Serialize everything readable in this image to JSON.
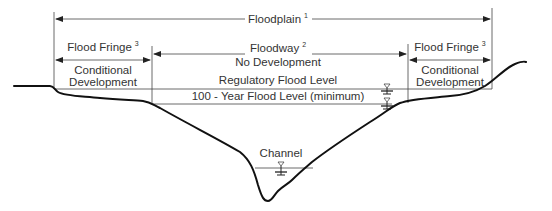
{
  "diagram": {
    "labels": {
      "floodplain": {
        "text": "Floodplain",
        "note": "1"
      },
      "floodway": {
        "text": "Floodway",
        "note": "2",
        "subtitle": "No Development"
      },
      "fringe_left": {
        "text": "Flood Fringe",
        "note": "3",
        "subtitle_line1": "Conditional",
        "subtitle_line2": "Development"
      },
      "fringe_right": {
        "text": "Flood Fringe",
        "note": "3",
        "subtitle_line1": "Conditional",
        "subtitle_line2": "Development"
      },
      "regulatory_flood_level": "Regulatory Flood Level",
      "hundred_year_flood_level": "100 - Year Flood Level (minimum)",
      "channel": "Channel"
    },
    "symbols": {
      "water_level": "water-surface-marker (inverted triangle with bars)"
    },
    "colors": {
      "line": "#111111",
      "text": "#333333",
      "background": "#ffffff"
    }
  }
}
